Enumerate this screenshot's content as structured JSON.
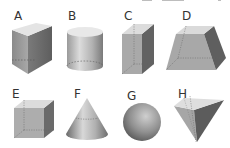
{
  "figure": {
    "shapes": [
      {
        "id": "A",
        "label": "A",
        "name": "triangular-prism"
      },
      {
        "id": "B",
        "label": "B",
        "name": "cylinder"
      },
      {
        "id": "C",
        "label": "C",
        "name": "rectangular-prism"
      },
      {
        "id": "D",
        "label": "D",
        "name": "frustum"
      },
      {
        "id": "E",
        "label": "E",
        "name": "cube"
      },
      {
        "id": "F",
        "label": "F",
        "name": "cone"
      },
      {
        "id": "G",
        "label": "G",
        "name": "sphere"
      },
      {
        "id": "H",
        "label": "H",
        "name": "inverted-pyramid"
      }
    ],
    "colors": {
      "light_face": "#d9d9d9",
      "mid_face": "#a8a8a8",
      "dark_face": "#6e6e6e",
      "hidden_edge": "#555555",
      "label": "#333333"
    }
  }
}
